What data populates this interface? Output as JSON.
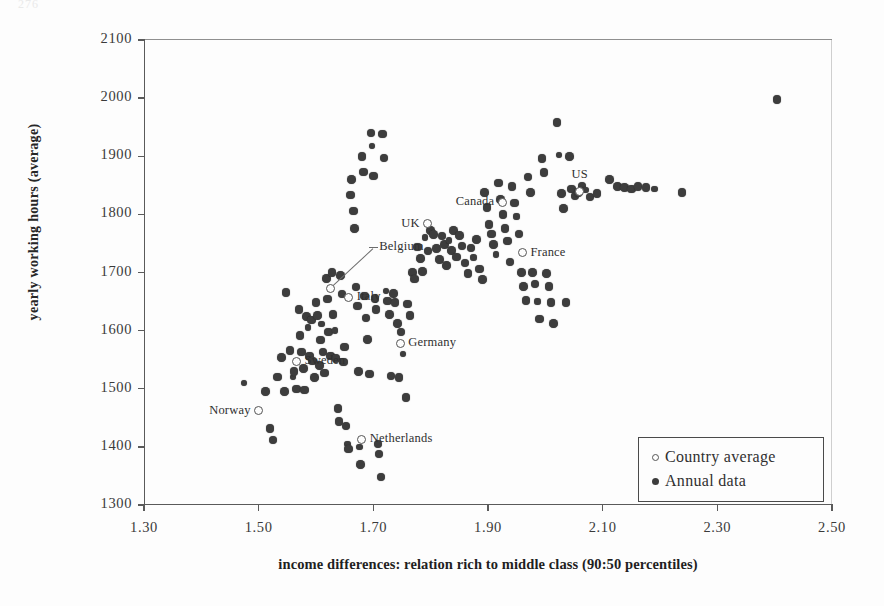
{
  "page_artifact": "276",
  "chart_data": {
    "type": "scatter",
    "title": "",
    "xlabel": "income differences: relation rich to middle class (90:50 percentiles)",
    "ylabel": "yearly working hours (average)",
    "xlim": [
      1.3,
      2.5
    ],
    "ylim": [
      1300,
      2100
    ],
    "xticks": [
      "1.30",
      "1.50",
      "1.70",
      "1.90",
      "2.10",
      "2.30",
      "2.50"
    ],
    "xtick_values": [
      1.3,
      1.5,
      1.7,
      1.9,
      2.1,
      2.3,
      2.5
    ],
    "yticks": [
      "1300",
      "1400",
      "1500",
      "1600",
      "1700",
      "1800",
      "1900",
      "2000",
      "2100"
    ],
    "ytick_values": [
      1300,
      1400,
      1500,
      1600,
      1700,
      1800,
      1900,
      2000,
      2100
    ],
    "grid": false,
    "legend_position": "bottom-right",
    "legend": [
      {
        "marker": "open-circle",
        "label": "Country average"
      },
      {
        "marker": "filled-circle",
        "label": "Annual data"
      }
    ],
    "series": [
      {
        "name": "Country average",
        "marker": "open-circle",
        "points": [
          {
            "label": "Norway",
            "x": 1.5,
            "y": 1462,
            "label_side": "left"
          },
          {
            "label": "Sweden",
            "x": 1.566,
            "y": 1547,
            "label_side": "right"
          },
          {
            "label": "Belgium",
            "x": 1.625,
            "y": 1673,
            "label_side": "leader"
          },
          {
            "label": "Italy",
            "x": 1.657,
            "y": 1657,
            "label_side": "right"
          },
          {
            "label": "Netherlands",
            "x": 1.68,
            "y": 1413,
            "label_side": "right"
          },
          {
            "label": "Germany",
            "x": 1.747,
            "y": 1578,
            "label_side": "right"
          },
          {
            "label": "UK",
            "x": 1.795,
            "y": 1784,
            "label_side": "left"
          },
          {
            "label": "Canada",
            "x": 1.925,
            "y": 1821,
            "label_side": "left"
          },
          {
            "label": "France",
            "x": 1.96,
            "y": 1734,
            "label_side": "right"
          },
          {
            "label": "US",
            "x": 2.06,
            "y": 1840,
            "label_side": "above"
          }
        ]
      },
      {
        "name": "Annual data",
        "marker": "filled-circle",
        "points": [
          {
            "x": 1.474,
            "y": 1510
          },
          {
            "x": 1.512,
            "y": 1495
          },
          {
            "x": 1.52,
            "y": 1432
          },
          {
            "x": 1.525,
            "y": 1412
          },
          {
            "x": 1.533,
            "y": 1520
          },
          {
            "x": 1.54,
            "y": 1554
          },
          {
            "x": 1.545,
            "y": 1495
          },
          {
            "x": 1.548,
            "y": 1666
          },
          {
            "x": 1.555,
            "y": 1566
          },
          {
            "x": 1.56,
            "y": 1520
          },
          {
            "x": 1.562,
            "y": 1530
          },
          {
            "x": 1.566,
            "y": 1500
          },
          {
            "x": 1.57,
            "y": 1636
          },
          {
            "x": 1.572,
            "y": 1592
          },
          {
            "x": 1.575,
            "y": 1563
          },
          {
            "x": 1.578,
            "y": 1535
          },
          {
            "x": 1.58,
            "y": 1498
          },
          {
            "x": 1.583,
            "y": 1624
          },
          {
            "x": 1.586,
            "y": 1605
          },
          {
            "x": 1.589,
            "y": 1556
          },
          {
            "x": 1.592,
            "y": 1618
          },
          {
            "x": 1.594,
            "y": 1548
          },
          {
            "x": 1.597,
            "y": 1519
          },
          {
            "x": 1.6,
            "y": 1648
          },
          {
            "x": 1.603,
            "y": 1626
          },
          {
            "x": 1.606,
            "y": 1540
          },
          {
            "x": 1.608,
            "y": 1584
          },
          {
            "x": 1.61,
            "y": 1611
          },
          {
            "x": 1.612,
            "y": 1563
          },
          {
            "x": 1.615,
            "y": 1527
          },
          {
            "x": 1.618,
            "y": 1690
          },
          {
            "x": 1.62,
            "y": 1654
          },
          {
            "x": 1.622,
            "y": 1598
          },
          {
            "x": 1.625,
            "y": 1556
          },
          {
            "x": 1.628,
            "y": 1700
          },
          {
            "x": 1.63,
            "y": 1628
          },
          {
            "x": 1.633,
            "y": 1600
          },
          {
            "x": 1.635,
            "y": 1552
          },
          {
            "x": 1.638,
            "y": 1466
          },
          {
            "x": 1.64,
            "y": 1444
          },
          {
            "x": 1.643,
            "y": 1695
          },
          {
            "x": 1.645,
            "y": 1663
          },
          {
            "x": 1.648,
            "y": 1546
          },
          {
            "x": 1.65,
            "y": 1572
          },
          {
            "x": 1.652,
            "y": 1436
          },
          {
            "x": 1.655,
            "y": 1405
          },
          {
            "x": 1.657,
            "y": 1396
          },
          {
            "x": 1.66,
            "y": 1833
          },
          {
            "x": 1.662,
            "y": 1860
          },
          {
            "x": 1.665,
            "y": 1806
          },
          {
            "x": 1.667,
            "y": 1776
          },
          {
            "x": 1.67,
            "y": 1675
          },
          {
            "x": 1.672,
            "y": 1642
          },
          {
            "x": 1.674,
            "y": 1530
          },
          {
            "x": 1.676,
            "y": 1400
          },
          {
            "x": 1.678,
            "y": 1370
          },
          {
            "x": 1.68,
            "y": 1900
          },
          {
            "x": 1.683,
            "y": 1873
          },
          {
            "x": 1.685,
            "y": 1660
          },
          {
            "x": 1.687,
            "y": 1622
          },
          {
            "x": 1.69,
            "y": 1585
          },
          {
            "x": 1.693,
            "y": 1525
          },
          {
            "x": 1.696,
            "y": 1940
          },
          {
            "x": 1.698,
            "y": 1918
          },
          {
            "x": 1.7,
            "y": 1866
          },
          {
            "x": 1.703,
            "y": 1655
          },
          {
            "x": 1.705,
            "y": 1636
          },
          {
            "x": 1.708,
            "y": 1405
          },
          {
            "x": 1.71,
            "y": 1388
          },
          {
            "x": 1.713,
            "y": 1348
          },
          {
            "x": 1.716,
            "y": 1938
          },
          {
            "x": 1.719,
            "y": 1897
          },
          {
            "x": 1.722,
            "y": 1668
          },
          {
            "x": 1.725,
            "y": 1651
          },
          {
            "x": 1.728,
            "y": 1628
          },
          {
            "x": 1.731,
            "y": 1522
          },
          {
            "x": 1.735,
            "y": 1664
          },
          {
            "x": 1.738,
            "y": 1648
          },
          {
            "x": 1.742,
            "y": 1612
          },
          {
            "x": 1.745,
            "y": 1519
          },
          {
            "x": 1.748,
            "y": 1598
          },
          {
            "x": 1.752,
            "y": 1560
          },
          {
            "x": 1.757,
            "y": 1485
          },
          {
            "x": 1.76,
            "y": 1646
          },
          {
            "x": 1.764,
            "y": 1626
          },
          {
            "x": 1.768,
            "y": 1700
          },
          {
            "x": 1.772,
            "y": 1689
          },
          {
            "x": 1.777,
            "y": 1744
          },
          {
            "x": 1.782,
            "y": 1724
          },
          {
            "x": 1.786,
            "y": 1702
          },
          {
            "x": 1.79,
            "y": 1760
          },
          {
            "x": 1.795,
            "y": 1737
          },
          {
            "x": 1.8,
            "y": 1772
          },
          {
            "x": 1.805,
            "y": 1765
          },
          {
            "x": 1.81,
            "y": 1741
          },
          {
            "x": 1.815,
            "y": 1722
          },
          {
            "x": 1.82,
            "y": 1763
          },
          {
            "x": 1.824,
            "y": 1748
          },
          {
            "x": 1.828,
            "y": 1712
          },
          {
            "x": 1.832,
            "y": 1755
          },
          {
            "x": 1.836,
            "y": 1738
          },
          {
            "x": 1.84,
            "y": 1772
          },
          {
            "x": 1.845,
            "y": 1727
          },
          {
            "x": 1.85,
            "y": 1764
          },
          {
            "x": 1.855,
            "y": 1746
          },
          {
            "x": 1.86,
            "y": 1716
          },
          {
            "x": 1.865,
            "y": 1698
          },
          {
            "x": 1.87,
            "y": 1742
          },
          {
            "x": 1.875,
            "y": 1726
          },
          {
            "x": 1.88,
            "y": 1757
          },
          {
            "x": 1.885,
            "y": 1706
          },
          {
            "x": 1.89,
            "y": 1688
          },
          {
            "x": 1.894,
            "y": 1838
          },
          {
            "x": 1.898,
            "y": 1812
          },
          {
            "x": 1.902,
            "y": 1783
          },
          {
            "x": 1.906,
            "y": 1766
          },
          {
            "x": 1.91,
            "y": 1748
          },
          {
            "x": 1.914,
            "y": 1731
          },
          {
            "x": 1.918,
            "y": 1854
          },
          {
            "x": 1.922,
            "y": 1826
          },
          {
            "x": 1.926,
            "y": 1800
          },
          {
            "x": 1.93,
            "y": 1776
          },
          {
            "x": 1.934,
            "y": 1754
          },
          {
            "x": 1.938,
            "y": 1718
          },
          {
            "x": 1.942,
            "y": 1848
          },
          {
            "x": 1.946,
            "y": 1820
          },
          {
            "x": 1.95,
            "y": 1796
          },
          {
            "x": 1.954,
            "y": 1766
          },
          {
            "x": 1.958,
            "y": 1700
          },
          {
            "x": 1.962,
            "y": 1676
          },
          {
            "x": 1.966,
            "y": 1652
          },
          {
            "x": 1.97,
            "y": 1864
          },
          {
            "x": 1.974,
            "y": 1838
          },
          {
            "x": 1.978,
            "y": 1700
          },
          {
            "x": 1.982,
            "y": 1680
          },
          {
            "x": 1.986,
            "y": 1650
          },
          {
            "x": 1.99,
            "y": 1620
          },
          {
            "x": 1.994,
            "y": 1896
          },
          {
            "x": 1.998,
            "y": 1872
          },
          {
            "x": 2.002,
            "y": 1698
          },
          {
            "x": 2.006,
            "y": 1676
          },
          {
            "x": 2.01,
            "y": 1648
          },
          {
            "x": 2.014,
            "y": 1612
          },
          {
            "x": 2.02,
            "y": 1958
          },
          {
            "x": 2.024,
            "y": 1902
          },
          {
            "x": 2.028,
            "y": 1836
          },
          {
            "x": 2.032,
            "y": 1810
          },
          {
            "x": 2.036,
            "y": 1648
          },
          {
            "x": 2.042,
            "y": 1900
          },
          {
            "x": 2.046,
            "y": 1844
          },
          {
            "x": 2.052,
            "y": 1832
          },
          {
            "x": 2.058,
            "y": 1838
          },
          {
            "x": 2.064,
            "y": 1848
          },
          {
            "x": 2.07,
            "y": 1842
          },
          {
            "x": 2.078,
            "y": 1830
          },
          {
            "x": 2.09,
            "y": 1836
          },
          {
            "x": 2.112,
            "y": 1860
          },
          {
            "x": 2.126,
            "y": 1848
          },
          {
            "x": 2.138,
            "y": 1846
          },
          {
            "x": 2.15,
            "y": 1844
          },
          {
            "x": 2.162,
            "y": 1848
          },
          {
            "x": 2.176,
            "y": 1846
          },
          {
            "x": 2.19,
            "y": 1844
          },
          {
            "x": 2.238,
            "y": 1838
          },
          {
            "x": 2.404,
            "y": 1998
          }
        ]
      }
    ]
  }
}
